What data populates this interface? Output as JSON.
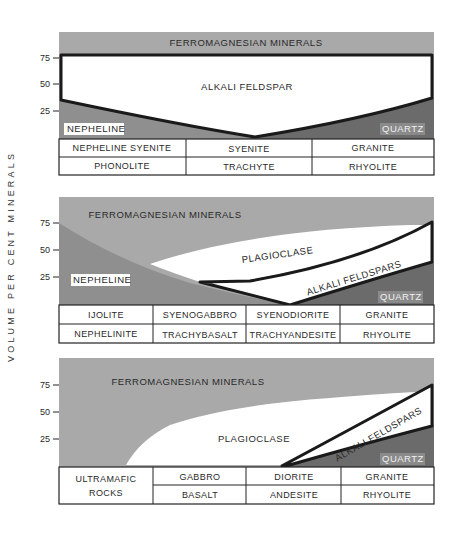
{
  "figure": {
    "y_axis_label": "VOLUME PER CENT MINERALS",
    "ticks": [
      "75",
      "50",
      "25"
    ],
    "colors": {
      "ferromagnesian": "#a9a9a9",
      "nepheline": "#8f8f8f",
      "quartz": "#6b6b6b",
      "feldspar": "#ffffff",
      "outline": "#1a1a1a"
    }
  },
  "panels": [
    {
      "regions": {
        "ferromagnesian": "FERROMAGNESIAN MINERALS",
        "alkali_feldspar": "ALKALI FELDSPAR",
        "nepheline": "NEPHELINE",
        "quartz": "QUARTZ"
      },
      "table": {
        "plutonic": [
          "NEPHELINE SYENITE",
          "SYENITE",
          "GRANITE"
        ],
        "volcanic": [
          "PHONOLITE",
          "TRACHYTE",
          "RHYOLITE"
        ]
      }
    },
    {
      "regions": {
        "ferromagnesian": "FERROMAGNESIAN MINERALS",
        "plagioclase": "PLAGIOCLASE",
        "alkali_feldspars": "ALKALI FELDSPARS",
        "nepheline": "NEPHELINE",
        "quartz": "QUARTZ"
      },
      "table": {
        "plutonic": [
          "IJOLITE",
          "SYENOGABBRO",
          "SYENODIORITE",
          "GRANITE"
        ],
        "volcanic": [
          "NEPHELINITE",
          "TRACHYBASALT",
          "TRACHYANDESITE",
          "RHYOLITE"
        ]
      }
    },
    {
      "regions": {
        "ferromagnesian": "FERROMAGNESIAN MINERALS",
        "plagioclase": "PLAGIOCLASE",
        "alkali_feldspars": "ALKALI FELDSPARS",
        "quartz": "QUARTZ"
      },
      "table": {
        "merged_first": [
          "ULTRAMAFIC",
          "ROCKS"
        ],
        "plutonic": [
          "GABBRO",
          "DIORITE",
          "GRANITE"
        ],
        "volcanic": [
          "BASALT",
          "ANDESITE",
          "RHYOLITE"
        ]
      }
    }
  ]
}
